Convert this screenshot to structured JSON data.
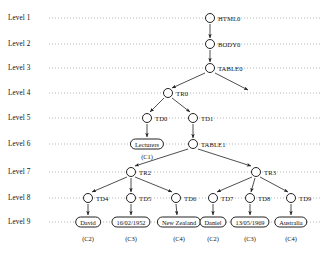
{
  "diagram": {
    "type": "tree",
    "width": 326,
    "height": 257,
    "levels": [
      {
        "id": "L1",
        "label": "Level 1",
        "y": 18
      },
      {
        "id": "L2",
        "label": "Level 2",
        "y": 44
      },
      {
        "id": "L3",
        "label": "Level 3",
        "y": 68
      },
      {
        "id": "L4",
        "label": "Level 4",
        "y": 93
      },
      {
        "id": "L5",
        "label": "Level 5",
        "y": 118
      },
      {
        "id": "L6",
        "label": "Level 6",
        "y": 144
      },
      {
        "id": "L7",
        "label": "Level 7",
        "y": 172
      },
      {
        "id": "L8",
        "label": "Level 8",
        "y": 198
      },
      {
        "id": "L9",
        "label": "Level 9",
        "y": 222
      }
    ],
    "guide_line": {
      "x_start": 49,
      "x_end": 322,
      "style": "dotted",
      "color": "#9a9a9a"
    },
    "nodes": [
      {
        "id": "HTML0",
        "label": "HTML0",
        "x": 210,
        "y": 18,
        "level": 1,
        "shape": "circle",
        "tag_side": "right"
      },
      {
        "id": "BODY0",
        "label": "BODY0",
        "x": 210,
        "y": 44,
        "level": 2,
        "shape": "circle",
        "tag_side": "right"
      },
      {
        "id": "TABLE0",
        "label": "TABLE0",
        "x": 210,
        "y": 68,
        "level": 3,
        "shape": "circle",
        "tag_side": "right"
      },
      {
        "id": "TR0",
        "label": "TR0",
        "x": 168,
        "y": 93,
        "level": 4,
        "shape": "circle",
        "tag_side": "right"
      },
      {
        "id": "TD0",
        "label": "TD0",
        "x": 147,
        "y": 118,
        "level": 5,
        "shape": "circle",
        "tag_side": "right"
      },
      {
        "id": "TD1",
        "label": "TD1",
        "x": 193,
        "y": 118,
        "level": 5,
        "shape": "circle",
        "tag_side": "right"
      },
      {
        "id": "TABLE1",
        "label": "TABLE1",
        "x": 193,
        "y": 144,
        "level": 6,
        "shape": "circle",
        "tag_side": "right"
      },
      {
        "id": "TR2",
        "label": "TR2",
        "x": 131,
        "y": 172,
        "level": 7,
        "shape": "circle",
        "tag_side": "right"
      },
      {
        "id": "TR3",
        "label": "TR3",
        "x": 256,
        "y": 172,
        "level": 7,
        "shape": "circle",
        "tag_side": "right"
      },
      {
        "id": "TD4",
        "label": "TD4",
        "x": 88,
        "y": 198,
        "level": 8,
        "shape": "circle",
        "tag_side": "right"
      },
      {
        "id": "TD5",
        "label": "TD5",
        "x": 131,
        "y": 198,
        "level": 8,
        "shape": "circle",
        "tag_side": "right"
      },
      {
        "id": "TD6",
        "label": "TD6",
        "x": 176,
        "y": 198,
        "level": 8,
        "shape": "circle",
        "tag_side": "right"
      },
      {
        "id": "TD7",
        "label": "TD7",
        "x": 213,
        "y": 198,
        "level": 8,
        "shape": "circle",
        "tag_side": "right"
      },
      {
        "id": "TD8",
        "label": "TD8",
        "x": 250,
        "y": 198,
        "level": 8,
        "shape": "circle",
        "tag_side": "right"
      },
      {
        "id": "TD9",
        "label": "TD9",
        "x": 291,
        "y": 198,
        "level": 8,
        "shape": "circle",
        "tag_side": "right"
      }
    ],
    "leaf_boxes": [
      {
        "id": "LEAF_LECTURERS",
        "label": "Lecturers",
        "x": 147,
        "y": 144,
        "level": 6,
        "ctag": "(C1)",
        "ctag_y": 156
      },
      {
        "id": "LEAF_DAVID",
        "label": "David",
        "x": 88,
        "y": 222,
        "level": 9,
        "ctag": "(C2)",
        "ctag_y": 238
      },
      {
        "id": "LEAF_DOB1",
        "label": "16/02/1952",
        "x": 131,
        "y": 222,
        "level": 9,
        "ctag": "(C3)",
        "ctag_y": 238
      },
      {
        "id": "LEAF_NZ",
        "label": "New Zealand",
        "x": 179,
        "y": 222,
        "level": 9,
        "ctag": "(C4)",
        "ctag_y": 238
      },
      {
        "id": "LEAF_DANIEL",
        "label": "Daniel",
        "x": 213,
        "y": 222,
        "level": 9,
        "ctag": "(C2)",
        "ctag_y": 238
      },
      {
        "id": "LEAF_DOB2",
        "label": "13/05/1969",
        "x": 250,
        "y": 222,
        "level": 9,
        "ctag": "(C3)",
        "ctag_y": 238
      },
      {
        "id": "LEAF_AUS",
        "label": "Australia",
        "x": 291,
        "y": 222,
        "level": 9,
        "ctag": "(C4)",
        "ctag_y": 238
      }
    ],
    "edges": [
      {
        "from": "HTML0",
        "to": "BODY0",
        "x1": 210,
        "y1": 24,
        "x2": 210,
        "y2": 38
      },
      {
        "from": "BODY0",
        "to": "TABLE0",
        "x1": 210,
        "y1": 50,
        "x2": 210,
        "y2": 62
      },
      {
        "from": "TABLE0",
        "to": "TR0",
        "x1": 205,
        "y1": 73,
        "x2": 172,
        "y2": 88
      },
      {
        "from": "TABLE0",
        "to": "DANGLING",
        "x1": 215,
        "y1": 73,
        "x2": 248,
        "y2": 90
      },
      {
        "from": "TR0",
        "to": "TD0",
        "x1": 164,
        "y1": 98,
        "x2": 150,
        "y2": 112
      },
      {
        "from": "TR0",
        "to": "TD1",
        "x1": 172,
        "y1": 98,
        "x2": 190,
        "y2": 112
      },
      {
        "from": "TD0",
        "to": "LEAF_LECTURERS",
        "x1": 147,
        "y1": 124,
        "x2": 147,
        "y2": 137
      },
      {
        "from": "TD1",
        "to": "TABLE1",
        "x1": 193,
        "y1": 124,
        "x2": 193,
        "y2": 138
      },
      {
        "from": "TABLE1",
        "to": "TR2",
        "x1": 188,
        "y1": 149,
        "x2": 135,
        "y2": 166
      },
      {
        "from": "TABLE1",
        "to": "TR3",
        "x1": 198,
        "y1": 149,
        "x2": 251,
        "y2": 166
      },
      {
        "from": "TR2",
        "to": "TD4",
        "x1": 127,
        "y1": 177,
        "x2": 92,
        "y2": 192
      },
      {
        "from": "TR2",
        "to": "TD5",
        "x1": 131,
        "y1": 178,
        "x2": 131,
        "y2": 192
      },
      {
        "from": "TR2",
        "to": "TD6",
        "x1": 135,
        "y1": 177,
        "x2": 172,
        "y2": 192
      },
      {
        "from": "TR3",
        "to": "TD7",
        "x1": 252,
        "y1": 177,
        "x2": 217,
        "y2": 192
      },
      {
        "from": "TR3",
        "to": "TD8",
        "x1": 255,
        "y1": 178,
        "x2": 251,
        "y2": 192
      },
      {
        "from": "TR3",
        "to": "TD9",
        "x1": 260,
        "y1": 177,
        "x2": 288,
        "y2": 192
      },
      {
        "from": "TD4",
        "to": "LEAF_DAVID",
        "x1": 88,
        "y1": 204,
        "x2": 88,
        "y2": 215
      },
      {
        "from": "TD5",
        "to": "LEAF_DOB1",
        "x1": 131,
        "y1": 204,
        "x2": 131,
        "y2": 215
      },
      {
        "from": "TD6",
        "to": "LEAF_NZ",
        "x1": 176,
        "y1": 204,
        "x2": 177,
        "y2": 215
      },
      {
        "from": "TD7",
        "to": "LEAF_DANIEL",
        "x1": 213,
        "y1": 204,
        "x2": 213,
        "y2": 215
      },
      {
        "from": "TD8",
        "to": "LEAF_DOB2",
        "x1": 250,
        "y1": 204,
        "x2": 250,
        "y2": 215
      },
      {
        "from": "TD9",
        "to": "LEAF_AUS",
        "x1": 291,
        "y1": 204,
        "x2": 291,
        "y2": 215
      }
    ],
    "colors": {
      "stroke": "#222222",
      "guide": "#9a9a9a",
      "text": "#111111",
      "background": "#ffffff"
    }
  }
}
